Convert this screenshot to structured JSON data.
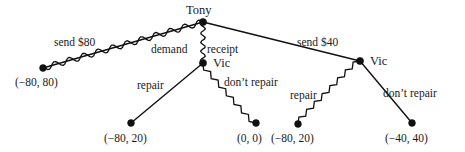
{
  "figure": {
    "type": "game-tree",
    "background_color": "#ffffff",
    "ink_color": "#111111"
  },
  "nodes": [
    {
      "id": "tony-root",
      "player": "Tony",
      "label": "Tony",
      "x": 203,
      "y": 22,
      "kind": "decision"
    },
    {
      "id": "vic-left",
      "player": "Vic",
      "label": "Vic",
      "x": 203,
      "y": 63,
      "kind": "decision"
    },
    {
      "id": "vic-right",
      "player": "Vic",
      "label": "Vic",
      "x": 360,
      "y": 61,
      "kind": "decision"
    },
    {
      "id": "term-a",
      "player": "",
      "label": "(−80, 80)",
      "x": 43,
      "y": 68,
      "kind": "terminal"
    },
    {
      "id": "term-b",
      "player": "",
      "label": "(−80, 20)",
      "x": 131,
      "y": 123,
      "kind": "terminal"
    },
    {
      "id": "term-c",
      "player": "",
      "label": "(0, 0)",
      "x": 256,
      "y": 123,
      "kind": "terminal"
    },
    {
      "id": "term-d",
      "player": "",
      "label": "(−80, 20)",
      "x": 298,
      "y": 124,
      "kind": "terminal"
    },
    {
      "id": "term-e",
      "player": "",
      "label": "(−40, 40)",
      "x": 412,
      "y": 123,
      "kind": "terminal"
    }
  ],
  "edges": [
    {
      "id": "edge-send-80",
      "from": "tony-root",
      "to": "term-a",
      "label": "send $80",
      "style": "wavy"
    },
    {
      "id": "edge-demand-receipt",
      "from": "tony-root",
      "to": "vic-left",
      "label": "demand receipt",
      "label_left": "demand",
      "label_right": "receipt",
      "style": "wavy-vertical"
    },
    {
      "id": "edge-send-40",
      "from": "tony-root",
      "to": "vic-right",
      "label": "send $40",
      "style": "straight"
    },
    {
      "id": "edge-repair-left",
      "from": "vic-left",
      "to": "term-b",
      "label": "repair",
      "style": "straight"
    },
    {
      "id": "edge-dont-repair-left",
      "from": "vic-left",
      "to": "term-c",
      "label": "don’t repair",
      "style": "zigzag"
    },
    {
      "id": "edge-repair-right",
      "from": "vic-right",
      "to": "term-d",
      "label": "repair",
      "style": "zigzag"
    },
    {
      "id": "edge-dont-repair-right",
      "from": "vic-right",
      "to": "term-e",
      "label": "don’t repair",
      "style": "straight"
    }
  ],
  "player_labels": [
    {
      "id": "player-label-tony",
      "text": "Tony",
      "x": 186,
      "y": 4
    },
    {
      "id": "player-label-vic-left",
      "text": "Vic",
      "x": 213,
      "y": 57
    },
    {
      "id": "player-label-vic-right",
      "text": "Vic",
      "x": 370,
      "y": 55
    }
  ],
  "action_labels": [
    {
      "id": "action-label-send-80",
      "text": "send $80",
      "x": 54,
      "y": 37
    },
    {
      "id": "action-label-demand",
      "text": "demand",
      "x": 151,
      "y": 44
    },
    {
      "id": "action-label-receipt",
      "text": "receipt",
      "x": 207,
      "y": 44
    },
    {
      "id": "action-label-send-40",
      "text": "send $40",
      "x": 297,
      "y": 37
    },
    {
      "id": "action-label-repair-left",
      "text": "repair",
      "x": 137,
      "y": 80
    },
    {
      "id": "action-label-dont-repair-left",
      "text": "don’t repair",
      "x": 224,
      "y": 77
    },
    {
      "id": "action-label-repair-right",
      "text": "repair",
      "x": 290,
      "y": 90
    },
    {
      "id": "action-label-dont-repair-right",
      "text": "don’t repair",
      "x": 383,
      "y": 88
    }
  ],
  "payoff_labels": [
    {
      "id": "payoff-label-a",
      "text": "(−80, 80)",
      "x": 15,
      "y": 77
    },
    {
      "id": "payoff-label-b",
      "text": "(−80, 20)",
      "x": 104,
      "y": 133
    },
    {
      "id": "payoff-label-c",
      "text": "(0, 0)",
      "x": 237,
      "y": 133
    },
    {
      "id": "payoff-label-d",
      "text": "(−80, 20)",
      "x": 271,
      "y": 133
    },
    {
      "id": "payoff-label-e",
      "text": "(−40, 40)",
      "x": 385,
      "y": 133
    }
  ]
}
